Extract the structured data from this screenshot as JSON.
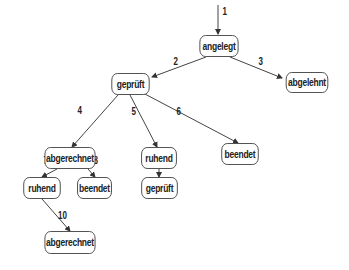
{
  "diagram": {
    "type": "state-tree",
    "nodes": [
      {
        "id": "n1",
        "label": "angelegt"
      },
      {
        "id": "n2",
        "label": "geprüft"
      },
      {
        "id": "n3",
        "label": "abgelehnt"
      },
      {
        "id": "n4",
        "label": "abgerechnet"
      },
      {
        "id": "n5",
        "label": "ruhend"
      },
      {
        "id": "n6",
        "label": "beendet"
      },
      {
        "id": "n7",
        "label": "ruhend"
      },
      {
        "id": "n8",
        "label": "beendet"
      },
      {
        "id": "n9",
        "label": "geprüft"
      },
      {
        "id": "n10",
        "label": "abgerechnet"
      }
    ],
    "edges": [
      {
        "label": "1",
        "from": "start",
        "to": "n1"
      },
      {
        "label": "2",
        "from": "n1",
        "to": "n2"
      },
      {
        "label": "3",
        "from": "n1",
        "to": "n3"
      },
      {
        "label": "4",
        "from": "n2",
        "to": "n4"
      },
      {
        "label": "5",
        "from": "n2",
        "to": "n5"
      },
      {
        "label": "6",
        "from": "n2",
        "to": "n6"
      },
      {
        "label": "7",
        "from": "n4",
        "to": "n7"
      },
      {
        "label": "8",
        "from": "n4",
        "to": "n8"
      },
      {
        "label": "9",
        "from": "n5",
        "to": "n9"
      },
      {
        "label": "10",
        "from": "n7",
        "to": "n10"
      }
    ]
  }
}
